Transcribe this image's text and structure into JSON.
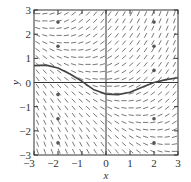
{
  "chart_data": {
    "type": "slope-field",
    "title": "",
    "xlabel": "x",
    "ylabel": "y",
    "xlim": [
      -3,
      3
    ],
    "ylim": [
      -3,
      3
    ],
    "x_ticks": [
      "-3",
      "-2",
      "-1",
      "0",
      "1",
      "2",
      "3"
    ],
    "y_ticks": [
      "-3",
      "-2",
      "-1",
      "0",
      "1",
      "2",
      "3"
    ],
    "grid": false,
    "slope_function_approx": "(x + y) / 2",
    "marked_points": [
      {
        "x": -2,
        "y": 2.5
      },
      {
        "x": -2,
        "y": 1.5
      },
      {
        "x": -2,
        "y": -0.5
      },
      {
        "x": -2,
        "y": -1.5
      },
      {
        "x": -2,
        "y": -2.5
      },
      {
        "x": 2,
        "y": 2.5
      },
      {
        "x": 2,
        "y": 1.5
      },
      {
        "x": 2,
        "y": 0.5
      },
      {
        "x": 2,
        "y": -1.5
      },
      {
        "x": 2,
        "y": -2.5
      }
    ],
    "solution_curve": {
      "x": [
        -3,
        -2.5,
        -2,
        -1.5,
        -1,
        -0.5,
        0,
        0.5,
        1,
        1.5,
        2,
        2.5,
        3
      ],
      "y": [
        0.7,
        0.72,
        0.6,
        0.35,
        0.05,
        -0.3,
        -0.48,
        -0.5,
        -0.4,
        -0.2,
        0.0,
        0.12,
        0.2
      ]
    }
  },
  "axes": {
    "x_label": "x",
    "y_label": "y"
  }
}
